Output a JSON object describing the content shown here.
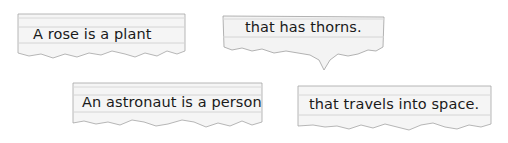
{
  "strips": [
    {
      "text": "A rose is a plant"
    },
    {
      "text": "that has thorns."
    },
    {
      "text": "An astronaut is a person"
    },
    {
      "text": "that travels into space."
    }
  ],
  "colors": {
    "paper": "#f4f4f4",
    "rule_line": "#d3d3d3",
    "edge": "#9a9a9a",
    "text": "#1a1a1a"
  }
}
